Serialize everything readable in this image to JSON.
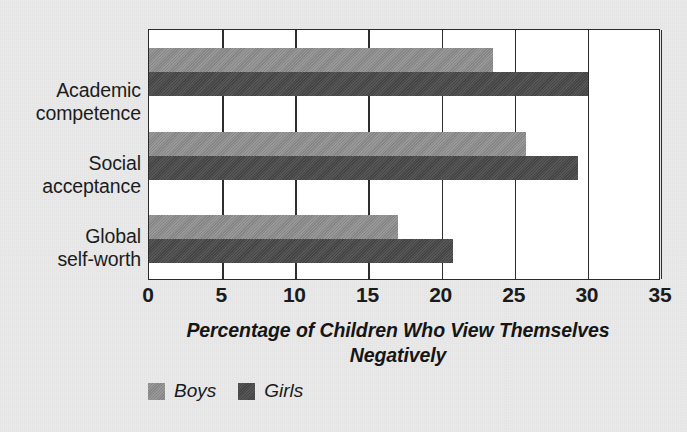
{
  "chart_data": {
    "type": "bar",
    "orientation": "horizontal",
    "title": "",
    "xlabel": "Percentage of Children Who View Themselves Negatively",
    "ylabel": "",
    "xlim": [
      0,
      35
    ],
    "xticks": [
      0,
      5,
      10,
      15,
      20,
      25,
      30,
      35
    ],
    "xtick_labels": [
      "0",
      "5",
      "10",
      "15",
      "20",
      "25",
      "30",
      "35"
    ],
    "grid": true,
    "grid_axis": "x",
    "legend_position": "bottom-left",
    "categories": [
      "Academic competence",
      "Social acceptance",
      "Global self-worth"
    ],
    "series": [
      {
        "name": "Boys",
        "color": "#8d8d8d",
        "values": [
          23.5,
          25.8,
          17.0
        ]
      },
      {
        "name": "Girls",
        "color": "#4c4c4c",
        "values": [
          30.0,
          29.3,
          20.8
        ]
      }
    ]
  },
  "axis_title": {
    "line1": "Percentage of Children Who View Themselves",
    "line2": "Negatively"
  },
  "category_labels": [
    {
      "line1": "Academic",
      "line2": "competence"
    },
    {
      "line1": "Social",
      "line2": "acceptance"
    },
    {
      "line1": "Global",
      "line2": "self-worth"
    }
  ],
  "legend": {
    "items": [
      {
        "label": "Boys",
        "color": "#8d8d8d"
      },
      {
        "label": "Girls",
        "color": "#4c4c4c"
      }
    ]
  },
  "colors": {
    "background": "#eaeaea",
    "plot_background": "#ffffff",
    "axis": "#2a2a2a",
    "boys": "#8d8d8d",
    "girls": "#4c4c4c"
  }
}
